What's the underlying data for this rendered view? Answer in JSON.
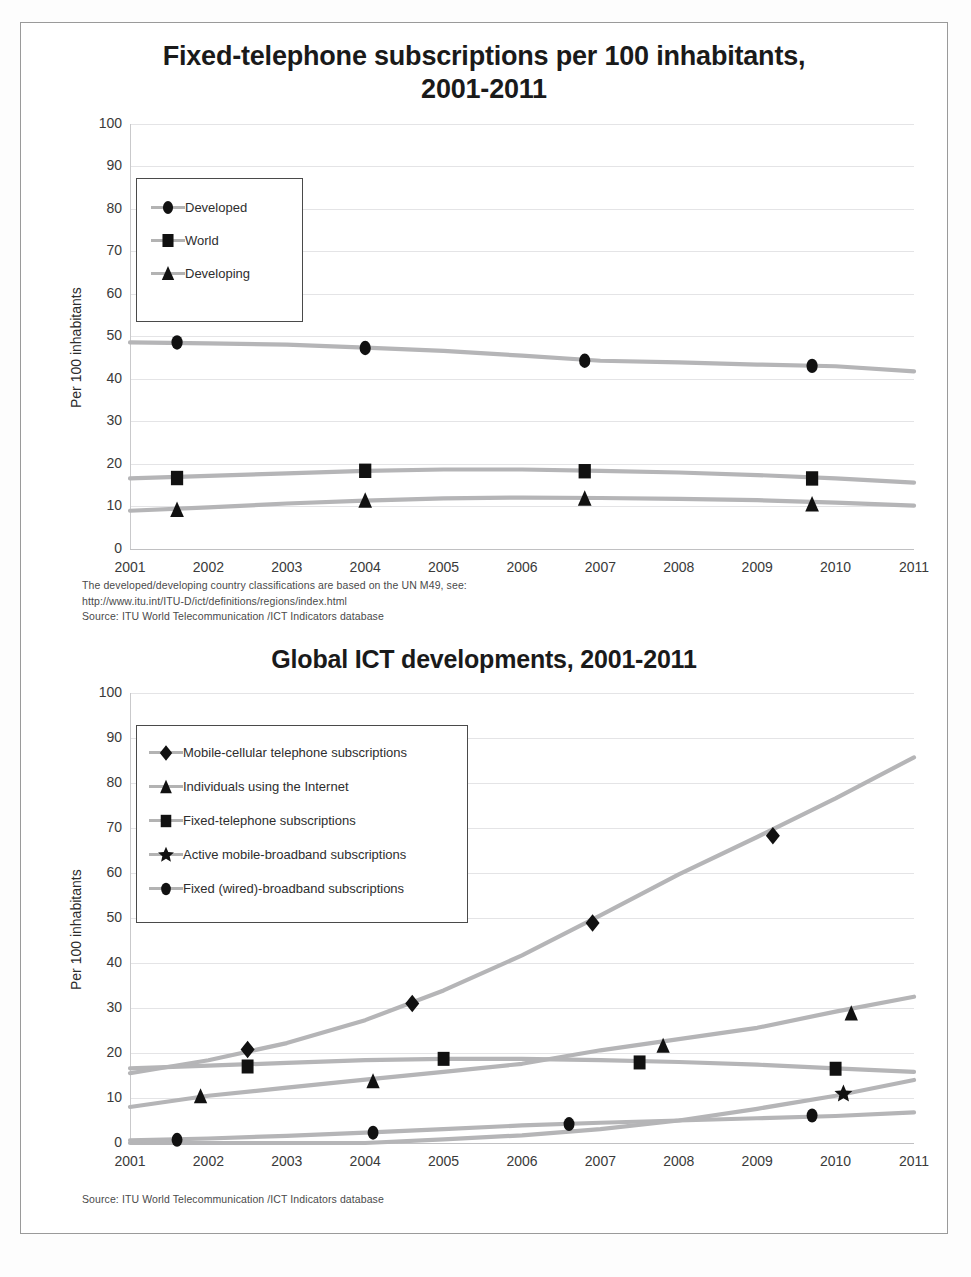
{
  "page": {
    "background": "#ffffff",
    "border_color": "#9a9a9a"
  },
  "chart1": {
    "title_line1": "Fixed-telephone subscriptions per 100 inhabitants,",
    "title_line2": "2001-2011",
    "ylabel": "Per 100 inhabitants",
    "yticks": [
      "100",
      "90",
      "80",
      "70",
      "60",
      "50",
      "40",
      "30",
      "20",
      "10",
      "0"
    ],
    "xticks": [
      "2001",
      "2002",
      "2003",
      "2004",
      "2005",
      "2006",
      "2007",
      "2008",
      "2009",
      "2010",
      "2011"
    ],
    "legend": [
      {
        "label": "Developed",
        "marker": "circle"
      },
      {
        "label": "World",
        "marker": "square"
      },
      {
        "label": "Developing",
        "marker": "triangle"
      }
    ],
    "notes": [
      "The developed/developing country classifications are based on the UN M49, see:",
      "http://www.itu.int/ITU-D/ict/definitions/regions/index.html",
      "Source:  ITU World Telecommunication /ICT Indicators database"
    ]
  },
  "chart2": {
    "title": "Global ICT developments, 2001-2011",
    "ylabel": "Per 100 inhabitants",
    "yticks": [
      "100",
      "90",
      "80",
      "70",
      "60",
      "50",
      "40",
      "30",
      "20",
      "10",
      "0"
    ],
    "xticks": [
      "2001",
      "2002",
      "2003",
      "2004",
      "2005",
      "2006",
      "2007",
      "2008",
      "2009",
      "2010",
      "2011"
    ],
    "legend": [
      {
        "label": "Mobile-cellular telephone subscriptions",
        "marker": "diamond"
      },
      {
        "label": "Individuals using the Internet",
        "marker": "triangle"
      },
      {
        "label": "Fixed-telephone subscriptions",
        "marker": "square"
      },
      {
        "label": "Active mobile-broadband subscriptions",
        "marker": "star"
      },
      {
        "label": "Fixed (wired)-broadband subscriptions",
        "marker": "circle"
      }
    ],
    "notes": [
      "Source:  ITU World Telecommunication /ICT Indicators database"
    ]
  },
  "chart_data": [
    {
      "type": "line",
      "title": "Fixed-telephone subscriptions per 100 inhabitants, 2001-2011",
      "xlabel": "",
      "ylabel": "Per 100 inhabitants",
      "ylim": [
        0,
        100
      ],
      "grid": true,
      "legend_position": "top-left",
      "x": [
        2001,
        2002,
        2003,
        2004,
        2005,
        2006,
        2007,
        2008,
        2009,
        2010,
        2011
      ],
      "series": [
        {
          "name": "Developed",
          "marker": "circle",
          "values": [
            48.6,
            48.4,
            48.1,
            47.4,
            46.6,
            45.5,
            44.3,
            43.9,
            43.4,
            43.0,
            41.8
          ],
          "marker_points": [
            {
              "x": 2001.6,
              "y": 48.6
            },
            {
              "x": 2004.0,
              "y": 47.3
            },
            {
              "x": 2006.8,
              "y": 44.3
            },
            {
              "x": 2009.7,
              "y": 43.1
            }
          ]
        },
        {
          "name": "World",
          "marker": "square",
          "values": [
            16.6,
            17.2,
            17.8,
            18.4,
            18.7,
            18.7,
            18.4,
            18.0,
            17.4,
            16.6,
            15.6
          ],
          "marker_points": [
            {
              "x": 2001.6,
              "y": 16.7
            },
            {
              "x": 2004.0,
              "y": 18.4
            },
            {
              "x": 2006.8,
              "y": 18.3
            },
            {
              "x": 2009.7,
              "y": 16.6
            }
          ]
        },
        {
          "name": "Developing",
          "marker": "triangle",
          "values": [
            9.0,
            9.8,
            10.7,
            11.4,
            11.9,
            12.1,
            12.0,
            11.8,
            11.5,
            10.9,
            10.2
          ],
          "marker_points": [
            {
              "x": 2001.6,
              "y": 9.2
            },
            {
              "x": 2004.0,
              "y": 11.4
            },
            {
              "x": 2006.8,
              "y": 11.9
            },
            {
              "x": 2009.7,
              "y": 10.5
            }
          ]
        }
      ]
    },
    {
      "type": "line",
      "title": "Global ICT developments, 2001-2011",
      "xlabel": "",
      "ylabel": "Per 100 inhabitants",
      "ylim": [
        0,
        100
      ],
      "grid": true,
      "legend_position": "top-left",
      "x": [
        2001,
        2002,
        2003,
        2004,
        2005,
        2006,
        2007,
        2008,
        2009,
        2010,
        2011
      ],
      "series": [
        {
          "name": "Mobile-cellular telephone subscriptions",
          "marker": "diamond",
          "values": [
            15.5,
            18.4,
            22.2,
            27.3,
            33.9,
            41.7,
            50.6,
            59.7,
            68.0,
            76.6,
            85.7
          ],
          "marker_points": [
            {
              "x": 2002.5,
              "y": 20.8
            },
            {
              "x": 2004.6,
              "y": 31.0
            },
            {
              "x": 2006.9,
              "y": 48.9
            },
            {
              "x": 2009.2,
              "y": 68.3
            }
          ]
        },
        {
          "name": "Individuals using the Internet",
          "marker": "triangle",
          "values": [
            8.0,
            10.5,
            12.3,
            14.1,
            15.8,
            17.6,
            20.6,
            23.1,
            25.6,
            29.2,
            32.5
          ],
          "marker_points": [
            {
              "x": 2001.9,
              "y": 10.4
            },
            {
              "x": 2004.1,
              "y": 13.7
            },
            {
              "x": 2007.8,
              "y": 21.6
            },
            {
              "x": 2010.2,
              "y": 28.8
            }
          ]
        },
        {
          "name": "Fixed-telephone subscriptions",
          "marker": "square",
          "values": [
            16.6,
            17.2,
            17.8,
            18.4,
            18.7,
            18.7,
            18.4,
            18.0,
            17.4,
            16.6,
            15.8
          ],
          "marker_points": [
            {
              "x": 2002.5,
              "y": 17.0
            },
            {
              "x": 2005.0,
              "y": 18.7
            },
            {
              "x": 2007.5,
              "y": 17.9
            },
            {
              "x": 2010.0,
              "y": 16.5
            }
          ]
        },
        {
          "name": "Active mobile-broadband subscriptions",
          "marker": "star",
          "values": [
            0.0,
            0.0,
            0.0,
            0.0,
            0.8,
            1.7,
            3.1,
            5.0,
            7.6,
            10.5,
            14.0
          ],
          "marker_points": [
            {
              "x": 2010.1,
              "y": 10.9
            }
          ]
        },
        {
          "name": "Fixed (wired)-broadband subscriptions",
          "marker": "circle",
          "values": [
            0.6,
            1.0,
            1.6,
            2.3,
            3.1,
            3.9,
            4.5,
            5.0,
            5.5,
            6.0,
            6.8
          ],
          "marker_points": [
            {
              "x": 2001.6,
              "y": 0.7
            },
            {
              "x": 2004.1,
              "y": 2.3
            },
            {
              "x": 2006.6,
              "y": 4.2
            },
            {
              "x": 2009.7,
              "y": 6.1
            }
          ]
        }
      ]
    }
  ]
}
